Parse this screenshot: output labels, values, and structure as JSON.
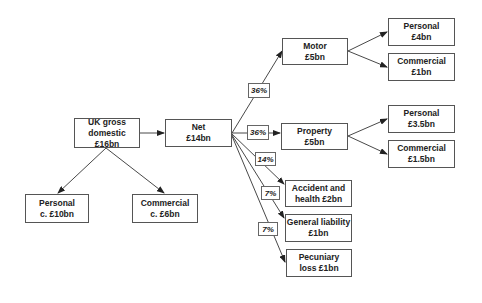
{
  "diagram": {
    "root": {
      "line1": "UK gross",
      "line2": "domestic £16bn"
    },
    "root_children": [
      {
        "id": "personal",
        "line1": "Personal",
        "line2": "c. £10bn"
      },
      {
        "id": "commercial",
        "line1": "Commercial",
        "line2": "c. £6bn"
      }
    ],
    "net": {
      "line1": "Net",
      "line2": "£14bn"
    },
    "net_children": [
      {
        "id": "motor",
        "line1": "Motor",
        "line2": "£5bn",
        "share": "36%",
        "children": [
          {
            "line1": "Personal",
            "line2": "£4bn"
          },
          {
            "line1": "Commercial",
            "line2": "£1bn"
          }
        ]
      },
      {
        "id": "property",
        "line1": "Property",
        "line2": "£5bn",
        "share": "36%",
        "children": [
          {
            "line1": "Personal",
            "line2": "£3.5bn"
          },
          {
            "line1": "Commercial",
            "line2": "£1.5bn"
          }
        ]
      },
      {
        "id": "accident",
        "line1": "Accident and",
        "line2": "health £2bn",
        "share": "14%"
      },
      {
        "id": "general",
        "line1": "General liability",
        "line2": "£1bn",
        "share": "7%"
      },
      {
        "id": "pecuniary",
        "line1": "Pecuniary",
        "line2": "loss £1bn",
        "share": "7%"
      }
    ]
  }
}
